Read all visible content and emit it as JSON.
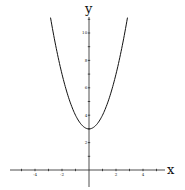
{
  "chart_data": {
    "type": "line",
    "title": "",
    "function": "y = x^2 + 3",
    "xlabel": "x",
    "ylabel": "y",
    "xlim": [
      -5.5,
      5.6
    ],
    "ylim": [
      -1,
      11.3
    ],
    "grid": false,
    "legend": null,
    "x_ticks": [
      -5,
      -4,
      -3,
      -2,
      -1,
      1,
      2,
      3,
      4,
      5
    ],
    "x_tick_labels": {
      "-4": "-4",
      "-2": "-2",
      "2": "2",
      "4": "4"
    },
    "y_ticks": [
      1,
      2,
      3,
      4,
      5,
      6,
      7,
      8,
      9,
      10,
      11
    ],
    "y_tick_labels": {
      "2": "2",
      "4": "4",
      "6": "6",
      "8": "8",
      "10": "10"
    },
    "series": [
      {
        "name": "y = x^2 + 3",
        "x": [
          -2.85,
          -2.5,
          -2,
          -1.5,
          -1,
          -0.5,
          0,
          0.5,
          1,
          1.5,
          2,
          2.5,
          2.85
        ],
        "values": [
          11.12,
          9.25,
          7,
          5.25,
          4,
          3.25,
          3,
          3.25,
          4,
          5.25,
          7,
          9.25,
          11.12
        ],
        "color": "#111111"
      }
    ],
    "vertex": {
      "x": 0,
      "y": 3
    }
  }
}
